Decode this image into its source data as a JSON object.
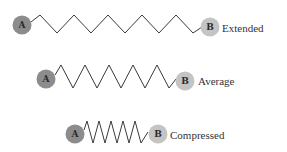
{
  "diagram": {
    "title": "",
    "colors": {
      "ball_a": "#8c8c8c",
      "ball_b": "#c4c4c4",
      "spring": "#3a3a3a",
      "text": "#333333"
    },
    "springs": [
      {
        "state": "Extended",
        "ball_a_label": "A",
        "ball_b_label": "B",
        "a": {
          "cx": 22,
          "cy": 25,
          "r": 9.5
        },
        "b": {
          "cx": 210,
          "cy": 27,
          "r": 9.5
        },
        "label_x": 222,
        "label_y": 28,
        "points": "31,22 40,15 57,33 74,15 91,33 108,15 125,33 142,15 159,33 176,15 193,33 202,27"
      },
      {
        "state": "Average",
        "ball_a_label": "A",
        "ball_b_label": "B",
        "a": {
          "cx": 46,
          "cy": 79,
          "r": 9.5
        },
        "b": {
          "cx": 185,
          "cy": 81,
          "r": 9.5
        },
        "label_x": 198,
        "label_y": 81,
        "points": "55,75 61,65 73,88 85,65 97,88 109,65 121,88 133,65 145,88 157,65 169,88 176,79"
      },
      {
        "state": "Compressed",
        "ball_a_label": "A",
        "ball_b_label": "B",
        "a": {
          "cx": 75,
          "cy": 134,
          "r": 9.5
        },
        "b": {
          "cx": 158,
          "cy": 134,
          "r": 9.5
        },
        "label_x": 170,
        "label_y": 135,
        "points": "84,130 87,121 93,143 99,121 105,143 111,121 117,143 123,121 129,143 135,121 141,143 148,132"
      }
    ]
  }
}
